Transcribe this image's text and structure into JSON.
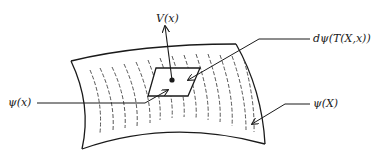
{
  "diagram": {
    "type": "manifold-surface",
    "labels": {
      "vector_field": "V(x)",
      "tangent_image": "dψ(T(X,x))",
      "point_image": "ψ(x)",
      "surface_image": "ψ(X)"
    },
    "colors": {
      "stroke": "#1a1a1a",
      "background": "#ffffff"
    }
  }
}
